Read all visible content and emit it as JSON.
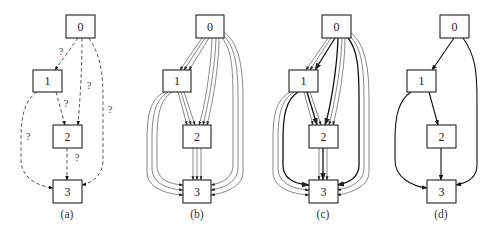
{
  "figure": {
    "panels": [
      {
        "id": "a",
        "caption": "(a)",
        "edge_style": "dashed-uncertain",
        "nodes": [
          {
            "label": "0",
            "x": 66,
            "y": 15
          },
          {
            "label": "1",
            "x": 33,
            "y": 70
          },
          {
            "label": "2",
            "x": 53,
            "y": 125
          },
          {
            "label": "3",
            "x": 53,
            "y": 180
          }
        ],
        "edges": [
          {
            "from": "0",
            "to": "1",
            "label": "?",
            "multiplicity": 1
          },
          {
            "from": "0",
            "to": "2",
            "label": "?",
            "multiplicity": 1
          },
          {
            "from": "0",
            "to": "3",
            "label": "?",
            "multiplicity": 1
          },
          {
            "from": "1",
            "to": "2",
            "label": "?",
            "multiplicity": 1
          },
          {
            "from": "1",
            "to": "3",
            "label": "?",
            "multiplicity": 1
          },
          {
            "from": "2",
            "to": "3",
            "label": "?",
            "multiplicity": 1
          }
        ]
      },
      {
        "id": "b",
        "caption": "(b)",
        "edge_style": "thin-multi",
        "nodes": [
          {
            "label": "0",
            "x": 196,
            "y": 15
          },
          {
            "label": "1",
            "x": 163,
            "y": 70
          },
          {
            "label": "2",
            "x": 183,
            "y": 125
          },
          {
            "label": "3",
            "x": 183,
            "y": 180
          }
        ],
        "edges": [
          {
            "from": "0",
            "to": "1",
            "multiplicity": 3
          },
          {
            "from": "0",
            "to": "2",
            "multiplicity": 3
          },
          {
            "from": "0",
            "to": "3",
            "multiplicity": 3
          },
          {
            "from": "1",
            "to": "2",
            "multiplicity": 3
          },
          {
            "from": "1",
            "to": "3",
            "multiplicity": 3
          },
          {
            "from": "2",
            "to": "3",
            "multiplicity": 3
          }
        ]
      },
      {
        "id": "c",
        "caption": "(c)",
        "edge_style": "thin-multi-with-bold",
        "nodes": [
          {
            "label": "0",
            "x": 322,
            "y": 15
          },
          {
            "label": "1",
            "x": 289,
            "y": 70
          },
          {
            "label": "2",
            "x": 309,
            "y": 125
          },
          {
            "label": "3",
            "x": 309,
            "y": 180
          }
        ],
        "edges": [
          {
            "from": "0",
            "to": "1",
            "multiplicity": 3,
            "bold_index": 2
          },
          {
            "from": "0",
            "to": "2",
            "multiplicity": 3,
            "bold_index": 0
          },
          {
            "from": "0",
            "to": "3",
            "multiplicity": 3,
            "bold_index": 0
          },
          {
            "from": "1",
            "to": "2",
            "multiplicity": 3,
            "bold_index": 1
          },
          {
            "from": "1",
            "to": "3",
            "multiplicity": 3,
            "bold_index": 2
          },
          {
            "from": "2",
            "to": "3",
            "multiplicity": 3,
            "bold_index": 1
          }
        ]
      },
      {
        "id": "d",
        "caption": "(d)",
        "edge_style": "solid-single",
        "nodes": [
          {
            "label": "0",
            "x": 440,
            "y": 15
          },
          {
            "label": "1",
            "x": 407,
            "y": 70
          },
          {
            "label": "2",
            "x": 427,
            "y": 125
          },
          {
            "label": "3",
            "x": 427,
            "y": 180
          }
        ],
        "edges": [
          {
            "from": "0",
            "to": "1",
            "multiplicity": 1
          },
          {
            "from": "0",
            "to": "3",
            "multiplicity": 1
          },
          {
            "from": "1",
            "to": "2",
            "multiplicity": 1
          },
          {
            "from": "1",
            "to": "3",
            "multiplicity": 1
          },
          {
            "from": "2",
            "to": "3",
            "multiplicity": 1
          }
        ]
      }
    ],
    "node_size": {
      "w": 29,
      "h": 23
    },
    "colors": {
      "stroke": "#222222",
      "thin_edge": "#555555",
      "bold_edge": "#111111",
      "background": "#ffffff"
    }
  }
}
